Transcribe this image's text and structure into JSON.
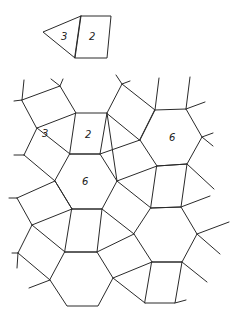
{
  "diagram": {
    "legend_tile": {
      "labels": [
        "3",
        "2"
      ],
      "description": "Triangle (3) joined to quadrilateral (2)"
    },
    "tiling_labels": {
      "triangle": "3",
      "square": "2",
      "hexagon_center": "6",
      "hexagon_right": "6"
    },
    "stroke_color": "#2a2a2a",
    "background": "#ffffff"
  }
}
